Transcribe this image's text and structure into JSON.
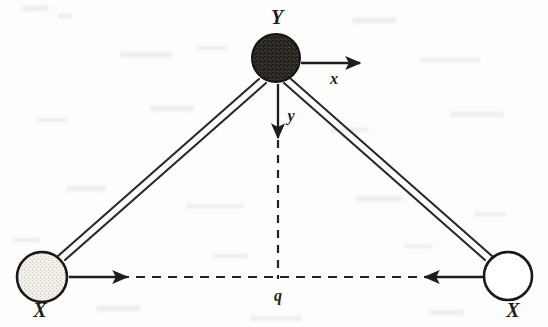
{
  "figure": {
    "kind": "molecular-geometry-diagram",
    "background_color": "#fdfdfc",
    "ink_color": "#1d1d1d",
    "width": 548,
    "height": 327
  },
  "atoms": [
    {
      "id": "apex",
      "label": "Y",
      "role": "central-atom",
      "fill_style": "dark-speckled",
      "fill_color": "#2b2724",
      "outline_color": "#141414",
      "cx": 276,
      "cy": 58,
      "r": 24,
      "label_x": 277,
      "label_y": 24
    },
    {
      "id": "left",
      "label": "X",
      "role": "terminal-atom",
      "fill_style": "light-stippled",
      "fill_color": "#eeece7",
      "outline_color": "#181818",
      "cx": 42,
      "cy": 277,
      "r": 25,
      "label_x": 40,
      "label_y": 317
    },
    {
      "id": "right",
      "label": "X",
      "role": "terminal-atom",
      "fill_style": "white",
      "fill_color": "#ffffff",
      "outline_color": "#181818",
      "cx": 508,
      "cy": 276,
      "r": 24,
      "label_x": 513,
      "label_y": 317
    }
  ],
  "bonds": [
    {
      "id": "bond-y-left",
      "from": "apex",
      "to": "left",
      "style": "double-line"
    },
    {
      "id": "bond-y-right",
      "from": "apex",
      "to": "right",
      "style": "double-line"
    }
  ],
  "vectors": [
    {
      "id": "x-vector",
      "label": "x",
      "direction": "right",
      "origin_atom": "apex",
      "x1": 301,
      "y1": 63,
      "x2": 364,
      "y2": 63,
      "label_x": 334,
      "label_y": 84,
      "line_style": "solid"
    },
    {
      "id": "y-vector",
      "label": "y",
      "direction": "down",
      "origin_atom": "apex",
      "x1": 278,
      "y1": 84,
      "x2": 278,
      "y2": 142,
      "label_x": 290,
      "label_y": 120,
      "line_style": "solid"
    },
    {
      "id": "left-x-vector",
      "label": "",
      "direction": "right",
      "origin_atom": "left",
      "x1": 69,
      "y1": 277,
      "x2": 131,
      "y2": 277,
      "line_style": "solid"
    },
    {
      "id": "right-x-vector",
      "label": "",
      "direction": "left",
      "origin_atom": "right",
      "x1": 483,
      "y1": 277,
      "x2": 421,
      "y2": 277,
      "line_style": "solid"
    }
  ],
  "construction_lines": [
    {
      "id": "horizontal-axis",
      "style": "dashed",
      "x1": 72,
      "y1": 277,
      "x2": 482,
      "y2": 277,
      "label": "q",
      "label_x": 278,
      "label_y": 300
    },
    {
      "id": "vertical-axis",
      "style": "dashed",
      "x1": 278,
      "y1": 140,
      "x2": 278,
      "y2": 279
    }
  ],
  "labels": {
    "apex_atom": "Y",
    "left_atom": "X",
    "right_atom": "X",
    "x_vector": "x",
    "y_vector": "y",
    "q_coordinate": "q"
  }
}
